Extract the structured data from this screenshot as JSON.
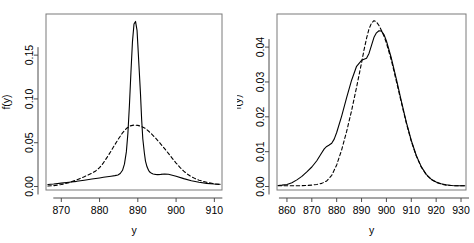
{
  "figure": {
    "background": "#ffffff",
    "line_color": "#000000",
    "panel_count": 2
  },
  "chart_data": [
    {
      "type": "line",
      "title": "",
      "xlabel": "y",
      "ylabel": "f(y)",
      "xlim": [
        866,
        912
      ],
      "ylim": [
        -0.004,
        0.197
      ],
      "xticks": [
        870,
        880,
        890,
        900,
        910
      ],
      "xticklabels": [
        "870",
        "880",
        "890",
        "900",
        "910"
      ],
      "yticks": [
        0.0,
        0.05,
        0.1,
        0.15
      ],
      "yticklabels": [
        "0.00",
        "0.05",
        "0.10",
        "0.15"
      ],
      "grid": false,
      "legend": "none",
      "box": true,
      "series": [
        {
          "name": "solid",
          "style": "solid",
          "color": "#000000",
          "x": [
            866.5,
            868,
            870,
            872,
            874,
            876,
            878,
            880,
            881,
            882,
            883,
            884,
            884.8,
            885.4,
            886,
            886.5,
            887,
            887.4,
            887.8,
            888.2,
            888.6,
            889,
            889.4,
            889.8,
            890,
            890.3,
            890.7,
            891,
            891.3,
            891.7,
            892,
            892.4,
            892.8,
            893.2,
            893.6,
            894,
            894.6,
            895.2,
            896,
            897,
            898,
            900,
            902,
            904,
            906,
            908,
            910,
            911.5
          ],
          "y": [
            0.0022,
            0.0028,
            0.0038,
            0.0048,
            0.0059,
            0.0072,
            0.0085,
            0.0098,
            0.0105,
            0.0112,
            0.0118,
            0.0124,
            0.0132,
            0.0148,
            0.0185,
            0.0255,
            0.0395,
            0.0605,
            0.0925,
            0.1305,
            0.1655,
            0.1855,
            0.1885,
            0.178,
            0.162,
            0.138,
            0.1055,
            0.0765,
            0.0545,
            0.0385,
            0.029,
            0.0225,
            0.0185,
            0.0162,
            0.015,
            0.0143,
            0.0138,
            0.0136,
            0.0138,
            0.0142,
            0.014,
            0.0118,
            0.009,
            0.0066,
            0.0048,
            0.0036,
            0.0028,
            0.0025
          ]
        },
        {
          "name": "dashed",
          "style": "dashed",
          "color": "#000000",
          "x": [
            866.5,
            868,
            870,
            872,
            874,
            876,
            878,
            879,
            880,
            881,
            882,
            883,
            884,
            885,
            886,
            887,
            888,
            889,
            890,
            891,
            892,
            893,
            894,
            895,
            896,
            897,
            898,
            899,
            900,
            901,
            902,
            903,
            904,
            905,
            906,
            908,
            910,
            911.5
          ],
          "y": [
            0.0005,
            0.001,
            0.0022,
            0.0044,
            0.0075,
            0.0112,
            0.0152,
            0.0178,
            0.0215,
            0.027,
            0.0335,
            0.0405,
            0.0478,
            0.0548,
            0.0612,
            0.0662,
            0.0692,
            0.0702,
            0.0698,
            0.0685,
            0.0662,
            0.0625,
            0.0582,
            0.0535,
            0.0485,
            0.0432,
            0.0378,
            0.0322,
            0.0268,
            0.0218,
            0.0175,
            0.014,
            0.0112,
            0.009,
            0.0072,
            0.0048,
            0.003,
            0.0022
          ]
        }
      ]
    },
    {
      "type": "line",
      "title": "",
      "xlabel": "y",
      "ylabel": "f(y)",
      "xlim": [
        856,
        932
      ],
      "ylim": [
        -0.001,
        0.0495
      ],
      "xticks": [
        860,
        870,
        880,
        890,
        900,
        910,
        920,
        930
      ],
      "xticklabels": [
        "860",
        "870",
        "880",
        "890",
        "900",
        "910",
        "920",
        "930"
      ],
      "yticks": [
        0.0,
        0.01,
        0.02,
        0.03,
        0.04
      ],
      "yticklabels": [
        "0.00",
        "0.01",
        "0.02",
        "0.03",
        "0.04"
      ],
      "grid": false,
      "legend": "none",
      "box": true,
      "series": [
        {
          "name": "solid",
          "style": "solid",
          "color": "#000000",
          "x": [
            856.5,
            858,
            860,
            862,
            864,
            866,
            868,
            870,
            872,
            874,
            875,
            876,
            877,
            878,
            879,
            880,
            882,
            884,
            886,
            888,
            890,
            891,
            892,
            893,
            894,
            895,
            896,
            897,
            898,
            899,
            900,
            902,
            904,
            906,
            908,
            910,
            912,
            914,
            916,
            918,
            920,
            922,
            924,
            926,
            928,
            930,
            931.5
          ],
          "y": [
            0.0003,
            0.0004,
            0.0006,
            0.0011,
            0.0019,
            0.0029,
            0.0042,
            0.0056,
            0.0074,
            0.0097,
            0.0108,
            0.0115,
            0.0119,
            0.0124,
            0.0136,
            0.0155,
            0.0202,
            0.0255,
            0.0305,
            0.0345,
            0.0362,
            0.0365,
            0.0368,
            0.0382,
            0.0405,
            0.0428,
            0.0441,
            0.0447,
            0.0446,
            0.0436,
            0.0418,
            0.0368,
            0.0308,
            0.0245,
            0.0185,
            0.0132,
            0.0089,
            0.0057,
            0.0035,
            0.0021,
            0.0013,
            0.0008,
            0.0005,
            0.0003,
            0.0002,
            0.0002,
            0.0002
          ]
        },
        {
          "name": "dashed",
          "style": "dashed",
          "color": "#000000",
          "x": [
            856.5,
            860,
            864,
            868,
            870,
            872,
            874,
            876,
            878,
            880,
            882,
            884,
            886,
            888,
            890,
            891,
            892,
            893,
            894,
            895,
            896,
            897,
            898,
            899,
            900,
            902,
            904,
            906,
            908,
            910,
            912,
            914,
            916,
            918,
            920,
            922,
            924,
            926,
            928,
            930,
            931.5
          ],
          "y": [
            0.0002,
            0.0002,
            0.0002,
            0.0003,
            0.0004,
            0.0006,
            0.0009,
            0.0016,
            0.0032,
            0.0062,
            0.0105,
            0.0158,
            0.0218,
            0.0285,
            0.0355,
            0.0392,
            0.0425,
            0.0452,
            0.0469,
            0.0476,
            0.0472,
            0.0462,
            0.0448,
            0.0432,
            0.0412,
            0.0362,
            0.0302,
            0.0241,
            0.0182,
            0.013,
            0.0088,
            0.0056,
            0.0034,
            0.002,
            0.0012,
            0.0007,
            0.0004,
            0.0003,
            0.0002,
            0.0002,
            0.0002
          ]
        }
      ]
    }
  ]
}
